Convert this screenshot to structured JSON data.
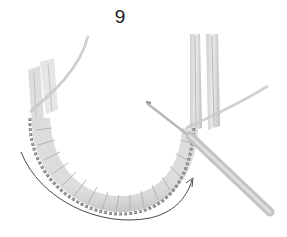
{
  "step": {
    "number": "9"
  },
  "illustration": {
    "subject": "crochet stitches worked around a U-shaped rope ring with crochet hook",
    "elements": [
      "rope-ring",
      "crochet-stitches",
      "crochet-hook",
      "yarn-strand",
      "direction-arrow"
    ],
    "colors": {
      "background": "#ffffff",
      "rope": "#d9d9d9",
      "rope_shadow": "#b5b5b5",
      "stitches": "#8a8a8a",
      "hook": "#c8c8c8",
      "arrow": "#4a4a4a",
      "text": "#1a1a1a"
    }
  }
}
